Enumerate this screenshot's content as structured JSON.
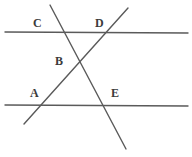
{
  "figure": {
    "name": "two-parallel-lines-with-two-transversals",
    "width": 192,
    "height": 157,
    "background_color": "#ffffff",
    "line_color": "#5a5a5a",
    "label_color": "#3b3b3b",
    "line_width": 1.4
  },
  "lines": [
    {
      "id": "top-parallel-line",
      "kind": "horizontal",
      "x1": 5,
      "y1": 32,
      "x2": 188,
      "y2": 33
    },
    {
      "id": "bottom-parallel-line",
      "kind": "horizontal",
      "x1": 5,
      "y1": 105,
      "x2": 188,
      "y2": 106
    },
    {
      "id": "descending-transversal",
      "kind": "transversal",
      "x1": 50,
      "y1": 5,
      "x2": 126,
      "y2": 149
    },
    {
      "id": "ascending-transversal",
      "kind": "transversal",
      "x1": 24,
      "y1": 124,
      "x2": 128,
      "y2": 8
    }
  ],
  "labels": [
    {
      "id": "label-c",
      "text": "C",
      "x": 33,
      "y": 17
    },
    {
      "id": "label-d",
      "text": "D",
      "x": 95,
      "y": 17
    },
    {
      "id": "label-b",
      "text": "B",
      "x": 55,
      "y": 55
    },
    {
      "id": "label-a",
      "text": "A",
      "x": 30,
      "y": 87
    },
    {
      "id": "label-e",
      "text": "E",
      "x": 111,
      "y": 87
    }
  ]
}
